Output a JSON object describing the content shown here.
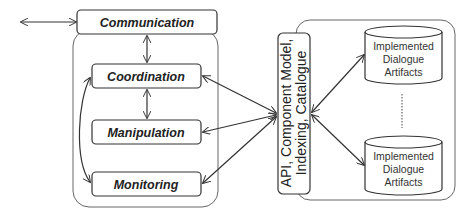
{
  "diagram": {
    "external_arrow": {
      "label": ""
    },
    "left_group": {
      "communication": {
        "label": "Communication"
      },
      "coordination": {
        "label": "Coordination"
      },
      "manipulation": {
        "label": "Manipulation"
      },
      "monitoring": {
        "label": "Monitoring"
      }
    },
    "api": {
      "line1": "API, Component Model,",
      "line2": "Indexing, Catalogue"
    },
    "repository": {
      "artifact_top": {
        "line1": "Implemented",
        "line2": "Dialogue",
        "line3": "Artifacts"
      },
      "artifact_bottom": {
        "line1": "Implemented",
        "line2": "Dialogue",
        "line3": "Artifacts"
      }
    },
    "colors": {
      "stroke": "#333333",
      "container_stroke": "#555555",
      "text": "#222222",
      "background": "#ffffff"
    }
  }
}
